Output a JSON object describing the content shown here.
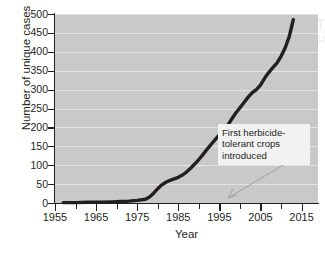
{
  "figure": {
    "background_color": "#ffffff",
    "plot_background_color": "#c9c9c9",
    "gridline_color": "#e8e8e8",
    "line_color": "#231f20",
    "annotation_background": "#f2f2f2"
  },
  "annotation": {
    "line1": "First herbicide-",
    "line2": "tolerant crops",
    "line3": "introduced",
    "points_to_year": 1996
  },
  "bleed_through": {
    "line1": "Types of GM Crops",
    "line2": "Herbicide Tolerance"
  },
  "chart_data": {
    "type": "line",
    "title": "",
    "xlabel": "Year",
    "ylabel": "Number of unique cases",
    "xlim": [
      1955,
      2019
    ],
    "ylim": [
      0,
      500
    ],
    "ytick_labels": [
      "0",
      "50",
      "100",
      "150",
      "200",
      "250",
      "300",
      "350",
      "400",
      "450",
      "500"
    ],
    "yticks": [
      0,
      50,
      100,
      150,
      200,
      250,
      300,
      350,
      400,
      450,
      500
    ],
    "xtick_labels": [
      "1955",
      "1965",
      "1975",
      "1985",
      "1995",
      "2005",
      "2015"
    ],
    "xticks": [
      1955,
      1965,
      1975,
      1985,
      1995,
      2005,
      2015
    ],
    "xminor_ticks": [
      1960,
      1970,
      1980,
      1990,
      2000,
      2010
    ],
    "grid": true,
    "legend": "none",
    "series": [
      {
        "name": "Cumulative unique cases of herbicide resistance",
        "x": [
          1957,
          1960,
          1963,
          1966,
          1969,
          1971,
          1973,
          1975,
          1977,
          1978,
          1979,
          1980,
          1981,
          1982,
          1983,
          1984,
          1985,
          1986,
          1987,
          1988,
          1989,
          1990,
          1991,
          1992,
          1993,
          1994,
          1995,
          1996,
          1997,
          1998,
          1999,
          2000,
          2001,
          2002,
          2003,
          2004,
          2005,
          2006,
          2007,
          2008,
          2009,
          2010,
          2011,
          2012,
          2013
        ],
        "values": [
          1,
          1,
          2,
          2,
          3,
          4,
          5,
          7,
          10,
          16,
          26,
          38,
          48,
          55,
          60,
          64,
          68,
          74,
          82,
          92,
          103,
          115,
          128,
          142,
          155,
          168,
          180,
          190,
          205,
          222,
          238,
          252,
          266,
          280,
          292,
          300,
          312,
          330,
          345,
          358,
          370,
          388,
          410,
          440,
          485
        ]
      }
    ]
  }
}
